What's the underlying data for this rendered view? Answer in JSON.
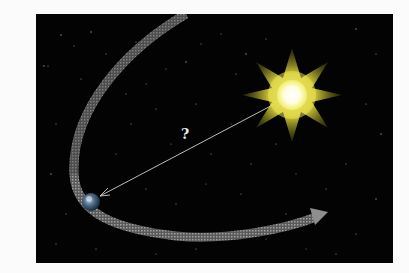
{
  "diagram": {
    "background_color": "#fbfbfb",
    "panel_color": "#030303",
    "sun": {
      "label": "sun",
      "core_color": "#ffffff",
      "glow_color": "#f4f06a",
      "ray_color": "#c8c020",
      "rays": 8
    },
    "earth": {
      "label": "earth",
      "color": "#5a7a9a"
    },
    "distance_line": {
      "label": "?",
      "color": "#cccccc"
    },
    "orbit": {
      "color": "#8a8a8a",
      "direction": "counterclockwise arrow pointing right"
    }
  }
}
